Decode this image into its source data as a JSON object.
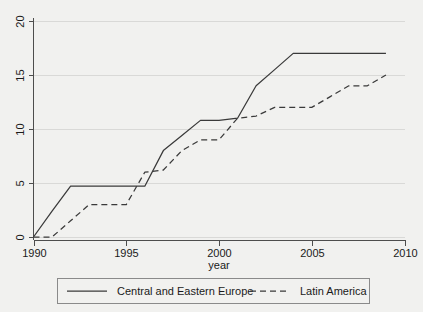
{
  "chart_data": {
    "type": "line",
    "title": "",
    "subtitle": "",
    "xlabel": "year",
    "ylabel": "",
    "xlim": [
      1990,
      2010
    ],
    "ylim": [
      0,
      20
    ],
    "xticks": [
      1990,
      1995,
      2000,
      2005,
      2010
    ],
    "xtick_labels": [
      "1990",
      "1995",
      "2000",
      "2005",
      "2010"
    ],
    "yticks": [
      0,
      5,
      10,
      15,
      20
    ],
    "ytick_labels": [
      "0",
      "5",
      "10",
      "15",
      "20"
    ],
    "grid": "horizontal",
    "legend_position": "below",
    "series": [
      {
        "name": "Central and Eastern Europe",
        "style": "solid",
        "color": "#3a3a3a",
        "x": [
          1990,
          1991,
          1992,
          1993,
          1994,
          1995,
          1996,
          1997,
          1998,
          1999,
          2000,
          2001,
          2002,
          2003,
          2004,
          2005,
          2006,
          2007,
          2008,
          2009
        ],
        "values": [
          0,
          2.4,
          4.7,
          4.7,
          4.7,
          4.7,
          4.7,
          8,
          9.4,
          10.8,
          10.8,
          11,
          14,
          15.5,
          17,
          17,
          17,
          17,
          17,
          17
        ]
      },
      {
        "name": "Latin America",
        "style": "dashed",
        "color": "#3a3a3a",
        "x": [
          1990,
          1991,
          1992,
          1993,
          1994,
          1995,
          1996,
          1997,
          1998,
          1999,
          2000,
          2001,
          2002,
          2003,
          2004,
          2005,
          2006,
          2007,
          2008,
          2009
        ],
        "values": [
          0,
          0,
          1.5,
          3,
          3,
          3,
          6,
          6.2,
          8,
          9,
          9,
          11,
          11.2,
          12,
          12,
          12,
          13,
          14,
          14,
          15
        ]
      }
    ]
  },
  "axes": {
    "x_axis_title": "year"
  },
  "legend": {
    "entries": [
      {
        "label": "Central and Eastern Europe",
        "style": "solid"
      },
      {
        "label": "Latin America",
        "style": "dashed"
      }
    ]
  }
}
